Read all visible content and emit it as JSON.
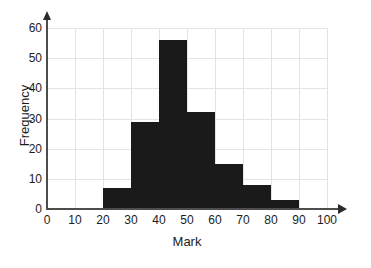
{
  "chart_data": {
    "type": "bar",
    "title": "",
    "subtitle": "",
    "xlabel": "Mark",
    "ylabel": "Frequency",
    "xlim": [
      0,
      100
    ],
    "ylim": [
      0,
      60
    ],
    "xticks": [
      0,
      10,
      20,
      30,
      40,
      50,
      60,
      70,
      80,
      90,
      100
    ],
    "yticks": [
      0,
      10,
      20,
      30,
      40,
      50,
      60
    ],
    "grid": true,
    "legend": null,
    "bin_width": 10,
    "bin_edges": [
      20,
      30,
      40,
      50,
      60,
      70,
      80,
      90
    ],
    "categories": [
      "20-30",
      "30-40",
      "40-50",
      "50-60",
      "60-70",
      "70-80",
      "80-90"
    ],
    "values": [
      7,
      29,
      56,
      32,
      15,
      8,
      3
    ],
    "bars": [
      {
        "label": "20-30",
        "x0": 20,
        "x1": 30,
        "value": 7
      },
      {
        "label": "30-40",
        "x0": 30,
        "x1": 40,
        "value": 29
      },
      {
        "label": "40-50",
        "x0": 40,
        "x1": 50,
        "value": 56
      },
      {
        "label": "50-60",
        "x0": 50,
        "x1": 60,
        "value": 32
      },
      {
        "label": "60-70",
        "x0": 60,
        "x1": 70,
        "value": 15
      },
      {
        "label": "70-80",
        "x0": 70,
        "x1": 80,
        "value": 8
      },
      {
        "label": "80-90",
        "x0": 80,
        "x1": 90,
        "value": 3
      }
    ],
    "colors": {
      "bar": "#1a1a1a",
      "grid": "#e3e3e3",
      "axis": "#4d4d4d",
      "text": "#1c1c1c",
      "background": "#ffffff"
    }
  }
}
